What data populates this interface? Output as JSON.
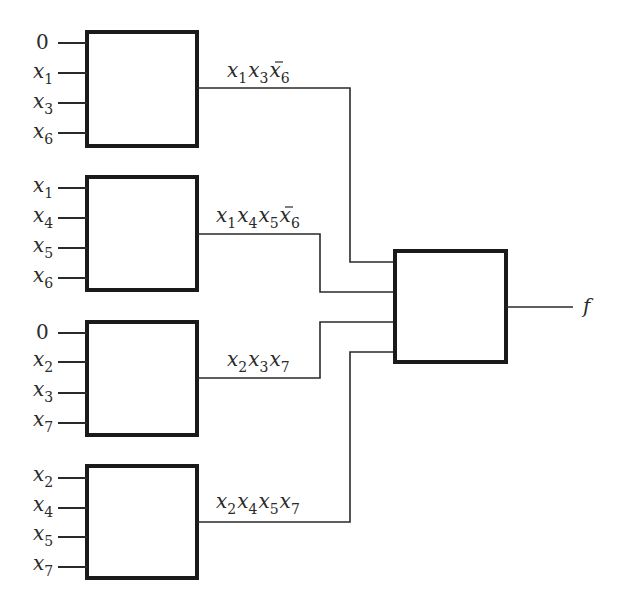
{
  "diagram": {
    "title": "",
    "blocks": [
      {
        "id": "block-1",
        "inputs": [
          {
            "var": "0",
            "sub": ""
          },
          {
            "var": "x",
            "sub": "1"
          },
          {
            "var": "x",
            "sub": "3"
          },
          {
            "var": "x",
            "sub": "6"
          }
        ],
        "output_label": {
          "terms": [
            {
              "var": "x",
              "sub": "1",
              "bar": false
            },
            {
              "var": "x",
              "sub": "3",
              "bar": false
            },
            {
              "var": "x",
              "sub": "6",
              "bar": true
            }
          ]
        },
        "output_text": "x1 x3 x̄6"
      },
      {
        "id": "block-2",
        "inputs": [
          {
            "var": "x",
            "sub": "1"
          },
          {
            "var": "x",
            "sub": "4"
          },
          {
            "var": "x",
            "sub": "5"
          },
          {
            "var": "x",
            "sub": "6"
          }
        ],
        "output_label": {
          "terms": [
            {
              "var": "x",
              "sub": "1",
              "bar": false
            },
            {
              "var": "x",
              "sub": "4",
              "bar": false
            },
            {
              "var": "x",
              "sub": "5",
              "bar": false
            },
            {
              "var": "x",
              "sub": "6",
              "bar": true
            }
          ]
        },
        "output_text": "x1 x4 x5 x̄6"
      },
      {
        "id": "block-3",
        "inputs": [
          {
            "var": "0",
            "sub": ""
          },
          {
            "var": "x",
            "sub": "2"
          },
          {
            "var": "x",
            "sub": "3"
          },
          {
            "var": "x",
            "sub": "7"
          }
        ],
        "output_label": {
          "terms": [
            {
              "var": "x",
              "sub": "2",
              "bar": false
            },
            {
              "var": "x",
              "sub": "3",
              "bar": false
            },
            {
              "var": "x",
              "sub": "7",
              "bar": false
            }
          ]
        },
        "output_text": "x2 x3 x7"
      },
      {
        "id": "block-4",
        "inputs": [
          {
            "var": "x",
            "sub": "2"
          },
          {
            "var": "x",
            "sub": "4"
          },
          {
            "var": "x",
            "sub": "5"
          },
          {
            "var": "x",
            "sub": "7"
          }
        ],
        "output_label": {
          "terms": [
            {
              "var": "x",
              "sub": "2",
              "bar": false
            },
            {
              "var": "x",
              "sub": "4",
              "bar": false
            },
            {
              "var": "x",
              "sub": "5",
              "bar": false
            },
            {
              "var": "x",
              "sub": "7",
              "bar": false
            }
          ]
        },
        "output_text": "x2 x4 x5 x7"
      }
    ],
    "final_block": {
      "id": "final-block",
      "inputs_count": 4,
      "output": "f"
    }
  }
}
